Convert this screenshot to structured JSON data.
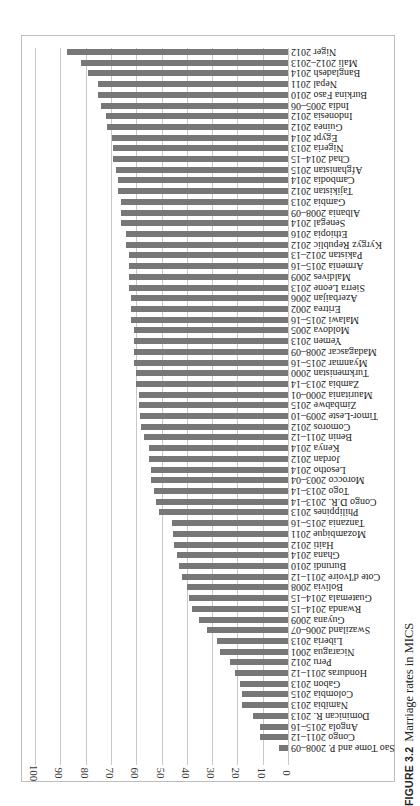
{
  "figure": {
    "number_label": "FIGURE 3.2",
    "caption": "Marriage rates in MICS"
  },
  "chart_data": {
    "type": "bar",
    "orientation": "vertical bars, page rotated 90° counter-clockwise",
    "title": "Marriage rates in MICS",
    "xlabel": "",
    "ylabel": "",
    "ylim": [
      0,
      100
    ],
    "yticks": [
      0,
      10,
      20,
      30,
      40,
      50,
      60,
      70,
      80,
      90,
      100
    ],
    "grid": true,
    "legend": null,
    "bar_color": "#777777",
    "categories": [
      "Sao Tome and P. 2008–09",
      "Congo 2011–12",
      "Angola 2015–16",
      "Dominican R. 2013",
      "Namibia 2013",
      "Colombia 2015",
      "Gabon 2013",
      "Honduras 2011–12",
      "Peru 2012",
      "Nicaragua 2001",
      "Liberia 2013",
      "Swaziland 2006–07",
      "Guyana 2009",
      "Rwanda 2014–15",
      "Guatemala 2014–15",
      "Bolivia 2008",
      "Cote d'Ivoire 2011–12",
      "Burundi 2010",
      "Ghana 2014",
      "Haiti 2012",
      "Mozambique 2011",
      "Tanzania 2015–16",
      "Philippines 2013",
      "Congo D.R. 2013–14",
      "Togo 2013–14",
      "Morocco 2003–04",
      "Lesotho 2014",
      "Jordan 2012",
      "Kenya 2014",
      "Benin 2011–12",
      "Comoros 2012",
      "Timor-Leste 2009–10",
      "Zimbabwe 2015",
      "Mauritania 2000–01",
      "Zambia 2013–14",
      "Turkmenistan 2000",
      "Myanmar 2015–16",
      "Madagascar 2008–09",
      "Yemen 2013",
      "Moldova 2005",
      "Malawi 2015–16",
      "Eritrea 2002",
      "Azerbaijan 2006",
      "Sierra Leone 2013",
      "Maldives 2009",
      "Armenia 2015–16",
      "Pakistan 2012–13",
      "Kyrgyz Republic 2012",
      "Ethiopia 2016",
      "Senegal 2014",
      "Albania 2008–09",
      "Gambia 2013",
      "Tajikistan 2012",
      "Cambodia 2014",
      "Afghanistan 2015",
      "Chad 2014–15",
      "Nigeria 2013",
      "Egypt 2014",
      "Guinea 2012",
      "Indonesia 2012",
      "India 2005–06",
      "Burkina Faso 2010",
      "Nepal 2011",
      "Bangladesh 2014",
      "Mali 2012–2013",
      "Niger 2012"
    ],
    "values": [
      3.5,
      11,
      11,
      14,
      18,
      18,
      19,
      21,
      23,
      27,
      28,
      32,
      35,
      38,
      39,
      40,
      42,
      43,
      44,
      45,
      45.5,
      46,
      51,
      52,
      53,
      54,
      54,
      55,
      55,
      57,
      58,
      58.5,
      59,
      59,
      60,
      60,
      61,
      61,
      61,
      61,
      62,
      62,
      62,
      63,
      63,
      63,
      63,
      64,
      64,
      66,
      66,
      66,
      67,
      67,
      68,
      69,
      69,
      69.5,
      71.5,
      72,
      74,
      75,
      75,
      79,
      82,
      87.5
    ]
  }
}
